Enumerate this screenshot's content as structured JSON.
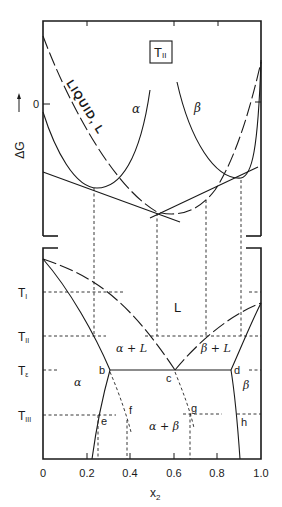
{
  "figure": {
    "top_panel": {
      "temperature_box": "T",
      "temperature_box_sub": "II",
      "y_axis_label": "ΔG",
      "y_zero_label": "0",
      "curve_labels": {
        "liquid": "LIQUID, L",
        "alpha": "α",
        "beta": "β"
      }
    },
    "bottom_panel": {
      "temperature_labels": [
        {
          "main": "T",
          "sub": "I"
        },
        {
          "main": "T",
          "sub": "II"
        },
        {
          "main": "T",
          "sub": "ε"
        },
        {
          "main": "T",
          "sub": "III"
        }
      ],
      "region_labels": {
        "liquid": "L",
        "alpha_plus_liquid": "α + L",
        "beta_plus_liquid": "β + L",
        "alpha": "α",
        "beta": "β",
        "alpha_plus_beta": "α + β"
      },
      "point_labels": [
        "b",
        "c",
        "d",
        "e",
        "f",
        "g",
        "h"
      ]
    },
    "x_axis": {
      "label": "x",
      "label_sub": "2",
      "ticks": [
        "0",
        "0.2",
        "0.4",
        "0.6",
        "0.8",
        "1.0"
      ]
    }
  }
}
